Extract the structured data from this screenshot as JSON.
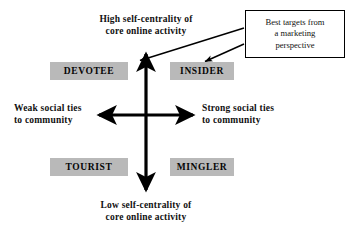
{
  "diagram": {
    "title_top": "High self-centrality of\ncore online activity",
    "title_bottom": "Low self-centrality of\ncore online activity",
    "label_left": "Weak social ties\nto community",
    "label_right": "Strong social ties\nto community",
    "segments": [
      {
        "name": "devotee",
        "label": "DEVOTEE",
        "quadrant": "top-left"
      },
      {
        "name": "insider",
        "label": "INSIDER",
        "quadrant": "top-right"
      },
      {
        "name": "tourist",
        "label": "TOURIST",
        "quadrant": "bottom-left"
      },
      {
        "name": "mingler",
        "label": "MINGLER",
        "quadrant": "bottom-right"
      }
    ],
    "callout": {
      "text": "Best targets from\na marketing\nperspective",
      "points_to": [
        "DEVOTEE",
        "INSIDER"
      ]
    },
    "colors": {
      "segment_fill": "#b9b9b9",
      "axis": "#000000",
      "text": "#111111",
      "background": "#ffffff"
    }
  }
}
